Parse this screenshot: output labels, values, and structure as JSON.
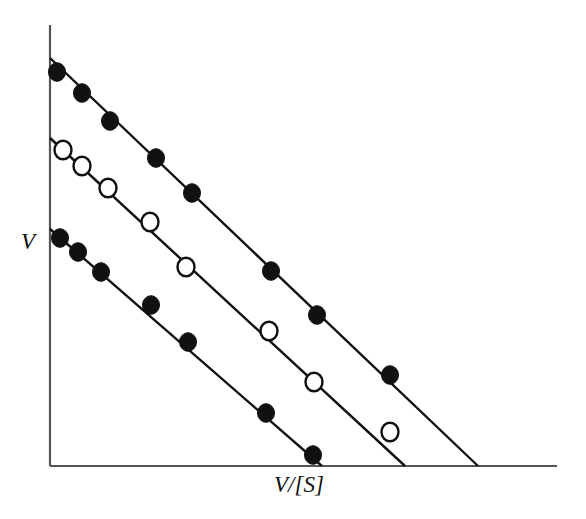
{
  "figure": {
    "title": "",
    "background_color": "#ffffff",
    "line_color": "#111111",
    "marker_fill_color": "#111111",
    "marker_open_color": "#ffffff",
    "axis_color": "#555555"
  },
  "labels": {
    "y_axis": "V",
    "x_axis": "V/[S]"
  },
  "chart_data": {
    "type": "scatter",
    "title": "",
    "xlabel": "V/[S]",
    "ylabel": "V",
    "grid": false,
    "legend": "none",
    "axis_ticks": "none",
    "xlim": [
      0,
      1
    ],
    "ylim": [
      0,
      1
    ],
    "axes_pixels": {
      "origin_x": 50,
      "origin_y": 466,
      "y_axis_top": 25,
      "x_axis_right": 557
    },
    "series": [
      {
        "name": "upper-line",
        "marker": "filled-circle",
        "marker_size": 17,
        "line_pixels": [
          [
            50,
            58
          ],
          [
            478,
            466
          ]
        ],
        "points_pixels": [
          [
            57,
            72
          ],
          [
            82,
            93
          ],
          [
            110,
            121
          ],
          [
            156,
            158
          ],
          [
            192,
            193
          ],
          [
            271,
            271
          ],
          [
            317,
            315
          ],
          [
            390,
            375
          ]
        ],
        "x_intercept_pixel": 478,
        "y_intercept_pixel": 58
      },
      {
        "name": "middle-line",
        "marker": "open-circle",
        "marker_size": 17,
        "line_pixels": [
          [
            50,
            138
          ],
          [
            405,
            466
          ]
        ],
        "points_pixels": [
          [
            63,
            150
          ],
          [
            82,
            166
          ],
          [
            108,
            188
          ],
          [
            150,
            222
          ],
          [
            186,
            267
          ],
          [
            269,
            331
          ],
          [
            314,
            382
          ],
          [
            390,
            432
          ]
        ],
        "x_intercept_pixel": 405,
        "y_intercept_pixel": 138
      },
      {
        "name": "lower-line",
        "marker": "filled-circle",
        "marker_size": 17,
        "line_pixels": [
          [
            50,
            229
          ],
          [
            322,
            466
          ]
        ],
        "points_pixels": [
          [
            60,
            238
          ],
          [
            78,
            252
          ],
          [
            101,
            272
          ],
          [
            151,
            305
          ],
          [
            188,
            342
          ],
          [
            266,
            413
          ],
          [
            313,
            455
          ]
        ],
        "x_intercept_pixel": 322,
        "y_intercept_pixel": 229
      }
    ]
  }
}
